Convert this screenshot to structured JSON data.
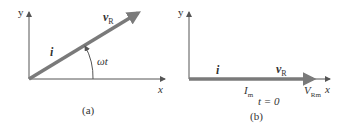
{
  "panel_a": {
    "caption": "(a)",
    "y_axis_label": "y",
    "x_axis_label": "x",
    "current_label": "i",
    "voltage_label_main": "v",
    "voltage_label_sub": "R",
    "angle_label": "ωt"
  },
  "panel_b": {
    "caption": "(b)",
    "y_axis_label": "y",
    "x_axis_label": "x",
    "current_label": "i",
    "voltage_label_main": "v",
    "voltage_label_sub": "R",
    "current_amp_main": "I",
    "current_amp_sub": "m",
    "voltage_amp_main": "V",
    "voltage_amp_sub": "Rm",
    "time_label": "t = 0"
  },
  "colors": {
    "axis": "#555555",
    "phasor": "#7a7a7a",
    "text": "#333333"
  }
}
